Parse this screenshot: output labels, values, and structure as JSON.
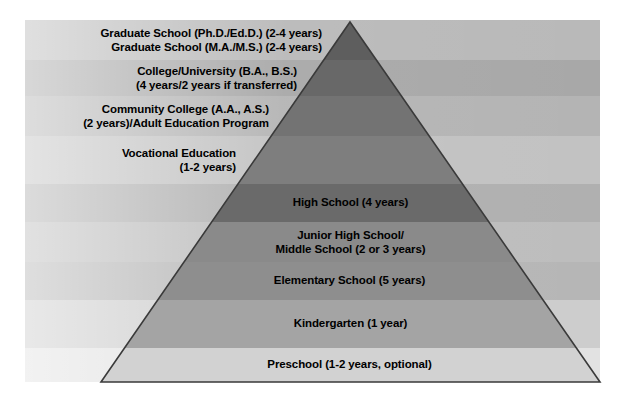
{
  "diagram": {
    "type": "pyramid",
    "background_color": "#ffffff",
    "outline_color": "#3a3a3a",
    "text_color": "#000000",
    "geometry": {
      "apex_x": 350,
      "apex_y": 22,
      "base_left_x": 101,
      "base_right_x": 600,
      "base_y": 382,
      "band_strip_left_x": 25,
      "band_strip_right_x": 600
    },
    "levels": [
      {
        "id": "graduate-school",
        "lines": [
          "Graduate School (Ph.D./Ed.D.) (2-4 years)",
          "Graduate School (M.A./M.S.) (2-4 years)"
        ],
        "align": "right",
        "y_top": 20,
        "y_bottom": 60,
        "strip_color": "#b9b9b9",
        "pyramid_color": "#5e5e5e"
      },
      {
        "id": "college-university",
        "lines": [
          "College/University (B.A., B.S.)",
          "(4 years/2 years if transferred)"
        ],
        "align": "right",
        "y_top": 60,
        "y_bottom": 96,
        "strip_color": "#a8a8a8",
        "pyramid_color": "#686868"
      },
      {
        "id": "community-college",
        "lines": [
          "Community College (A.A., A.S.)",
          "(2 years)/Adult Education Program"
        ],
        "align": "right",
        "y_top": 96,
        "y_bottom": 136,
        "strip_color": "#b4b4b4",
        "pyramid_color": "#737373"
      },
      {
        "id": "vocational-education",
        "lines": [
          "Vocational Education",
          "(1-2 years)"
        ],
        "align": "right",
        "y_top": 136,
        "y_bottom": 184,
        "strip_color": "#c2c2c2",
        "pyramid_color": "#7e7e7e"
      },
      {
        "id": "high-school",
        "lines": [
          "High School (4 years)"
        ],
        "align": "center",
        "y_top": 184,
        "y_bottom": 222,
        "strip_color": "#b0b0b0",
        "pyramid_color": "#6a6a6a"
      },
      {
        "id": "junior-high-middle-school",
        "lines": [
          "Junior High School/",
          "Middle School (2 or 3 years)"
        ],
        "align": "center",
        "y_top": 222,
        "y_bottom": 262,
        "strip_color": "#bdbdbd",
        "pyramid_color": "#8a8a8a"
      },
      {
        "id": "elementary-school",
        "lines": [
          "Elementary School (5 years)"
        ],
        "align": "center",
        "y_top": 262,
        "y_bottom": 300,
        "strip_color": "#b6b6b6",
        "pyramid_color": "#8e8e8e"
      },
      {
        "id": "kindergarten",
        "lines": [
          "Kindergarten (1 year)"
        ],
        "align": "center",
        "y_top": 300,
        "y_bottom": 348,
        "strip_color": "#cdcdcd",
        "pyramid_color": "#a4a4a4"
      },
      {
        "id": "preschool",
        "lines": [
          "Preschool (1-2 years, optional)"
        ],
        "align": "center",
        "y_top": 348,
        "y_bottom": 382,
        "strip_color": "#e2e2e2",
        "pyramid_color": "#d2d2d2"
      }
    ]
  }
}
